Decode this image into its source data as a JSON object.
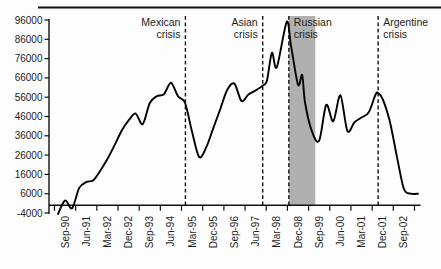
{
  "figure": {
    "top_rule_color": "#111111",
    "background": "#fdfdfd"
  },
  "chart_data": {
    "type": "line",
    "title": "",
    "xlabel": "",
    "ylabel": "",
    "line_color": "#000000",
    "axis_color": "#111111",
    "y_min": -4000,
    "y_max": 96000,
    "y_step": 10000,
    "y_tick_labels": [
      "96000",
      "86000",
      "76000",
      "66000",
      "56000",
      "46000",
      "36000",
      "26000",
      "16000",
      "6000",
      "-4000"
    ],
    "x_tick_labels": [
      "Sep-90",
      "Jun-91",
      "Mar-92",
      "Dec-92",
      "Sep-93",
      "Jun-94",
      "Mar-95",
      "Dec-95",
      "Sep-96",
      "Jun-97",
      "Mar-98",
      "Dec-98",
      "Sep-99",
      "Jun-00",
      "Mar-01",
      "Dec-01",
      "Sep-02"
    ],
    "x_tick_label_indices": [
      1,
      4,
      7,
      10,
      13,
      16,
      19,
      22,
      25,
      28,
      31,
      34,
      37,
      40,
      43,
      46,
      49
    ],
    "x_index_unit": "quarter (index 0 = Jun-90, index 51 = Mar-03)",
    "series": [
      {
        "points": [
          [
            0,
            -4500
          ],
          [
            1,
            2500
          ],
          [
            2,
            -1500
          ],
          [
            3,
            9000
          ],
          [
            4,
            12000
          ],
          [
            5,
            13000
          ],
          [
            6,
            18000
          ],
          [
            7,
            24000
          ],
          [
            8,
            31000
          ],
          [
            9,
            38500
          ],
          [
            10,
            44000
          ],
          [
            11,
            47500
          ],
          [
            12,
            42000
          ],
          [
            13,
            53000
          ],
          [
            14,
            56500
          ],
          [
            15,
            57500
          ],
          [
            16,
            63500
          ],
          [
            17,
            56500
          ],
          [
            18,
            53000
          ],
          [
            19,
            38000
          ],
          [
            20,
            25000
          ],
          [
            21,
            30000
          ],
          [
            22,
            40000
          ],
          [
            23,
            50000
          ],
          [
            24,
            60000
          ],
          [
            25,
            63000
          ],
          [
            26,
            54000
          ],
          [
            27,
            57500
          ],
          [
            28,
            59500
          ],
          [
            29,
            62000
          ],
          [
            29.6,
            64500
          ],
          [
            30.3,
            79000
          ],
          [
            31,
            71500
          ],
          [
            32.4,
            95000
          ],
          [
            33,
            83000
          ],
          [
            34,
            62500
          ],
          [
            34.6,
            67500
          ],
          [
            35,
            53000
          ],
          [
            36,
            38000
          ],
          [
            37,
            33500
          ],
          [
            38,
            52000
          ],
          [
            39,
            43500
          ],
          [
            40,
            57000
          ],
          [
            41,
            38500
          ],
          [
            42,
            43000
          ],
          [
            43,
            45500
          ],
          [
            44,
            48000
          ],
          [
            45,
            57500
          ],
          [
            45.4,
            58000
          ],
          [
            46,
            55000
          ],
          [
            47,
            43500
          ],
          [
            48,
            25500
          ],
          [
            49,
            8500
          ],
          [
            50,
            6000
          ],
          [
            51,
            6000
          ]
        ]
      }
    ],
    "annotations": [
      {
        "id": "mexican",
        "line1": "Mexican",
        "line2": "crisis",
        "index": 18.05,
        "label_side": "left"
      },
      {
        "id": "asian",
        "line1": "Asian",
        "line2": "crisis",
        "index": 29.0,
        "label_side": "left"
      },
      {
        "id": "russian",
        "line1": "Russian",
        "line2": "crisis",
        "index": 32.7,
        "label_side": "right"
      },
      {
        "id": "argentine",
        "line1": "Argentine",
        "line2": "crisis",
        "index": 45.35,
        "label_side": "right"
      }
    ],
    "shaded_band": {
      "id": "russian-crisis-band",
      "start_index": 32.7,
      "end_index": 36.45,
      "color": "#b0b0b0"
    },
    "legend": "none",
    "grid": "off"
  }
}
